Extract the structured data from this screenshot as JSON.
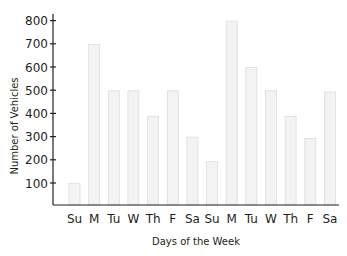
{
  "chart_data": {
    "type": "bar",
    "title": "",
    "xlabel": "Days of the Week",
    "ylabel": "Number of Vehicles",
    "categories": [
      "Su",
      "M",
      "Tu",
      "W",
      "Th",
      "F",
      "Sa",
      "Su",
      "M",
      "Tu",
      "W",
      "Th",
      "F",
      "Sa"
    ],
    "values": [
      100,
      700,
      500,
      500,
      390,
      500,
      300,
      195,
      800,
      600,
      500,
      390,
      295,
      495
    ],
    "yticks": [
      100,
      200,
      300,
      400,
      500,
      600,
      700,
      800
    ],
    "ylim": [
      0,
      850
    ],
    "grid": false,
    "legend": null,
    "colors": {
      "bar_fill": "#f3f3f3",
      "bar_stroke": "#dcdcdc",
      "axis": "#231f20",
      "text": "#231f20"
    }
  }
}
